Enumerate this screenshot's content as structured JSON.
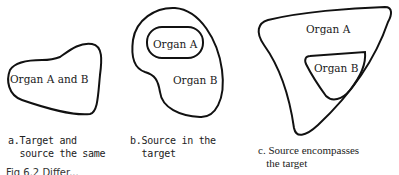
{
  "panels": [
    {
      "id": "a",
      "organ_labels": [
        "Organ A and B"
      ],
      "caption_line1": "a.Target and",
      "caption_line2": "  source the same"
    },
    {
      "id": "b",
      "organ_labels": [
        "Organ A",
        "Organ B"
      ],
      "caption_line1": "b.Source in the",
      "caption_line2": "  target"
    },
    {
      "id": "c",
      "organ_labels": [
        "Organ A",
        "Organ B"
      ],
      "caption_line1": "c. Source encompasses",
      "caption_line2": "   the target"
    }
  ],
  "figure_caption_partial": "Fig 6.2 Differ..."
}
